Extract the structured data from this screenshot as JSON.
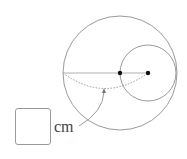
{
  "diagram": {
    "type": "geometry",
    "colors": {
      "stroke": "#9a9a9a",
      "dot": "#111111",
      "text": "#444444",
      "background": "#ffffff"
    },
    "large_circle": {
      "cx": 120,
      "cy": 73,
      "r": 57
    },
    "small_circle": {
      "cx": 148,
      "cy": 73,
      "r": 28
    },
    "points": [
      {
        "name": "large-circle-center",
        "x": 120,
        "y": 73
      },
      {
        "name": "small-circle-center",
        "x": 148,
        "y": 73
      }
    ],
    "segment": {
      "x1": 63,
      "y1": 73,
      "x2": 148,
      "y2": 73
    },
    "measured_arc": {
      "from": [
        63,
        73
      ],
      "to": [
        148,
        73
      ],
      "style": "dotted"
    },
    "pointer_arrow": {
      "from": [
        79,
        126
      ],
      "to": [
        104,
        89
      ]
    }
  },
  "answer": {
    "value": "",
    "unit": "cm"
  }
}
